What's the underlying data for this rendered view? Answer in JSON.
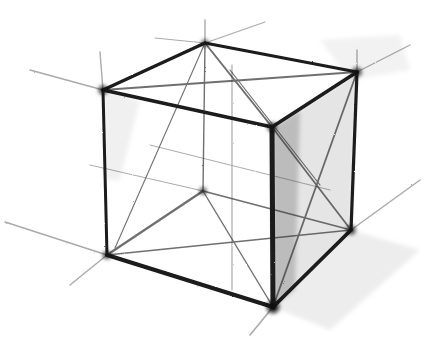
{
  "image": {
    "subject": "Pencil sketch of a wireframe cube with construction lines",
    "medium": "graphite pencil on white paper",
    "colors": {
      "paper": "#ffffff",
      "graphite": "#1a1a1a",
      "shading": "#555555"
    }
  },
  "cube": {
    "visible_vertices": [
      "top-back",
      "top-left",
      "top-right",
      "top-front",
      "bottom-left",
      "bottom-right",
      "bottom-front"
    ],
    "hidden_vertices": [
      "bottom-back"
    ],
    "features": [
      "outer edges",
      "hidden edges",
      "face diagonals",
      "extended perspective guide lines",
      "hatched shading on right face"
    ]
  }
}
